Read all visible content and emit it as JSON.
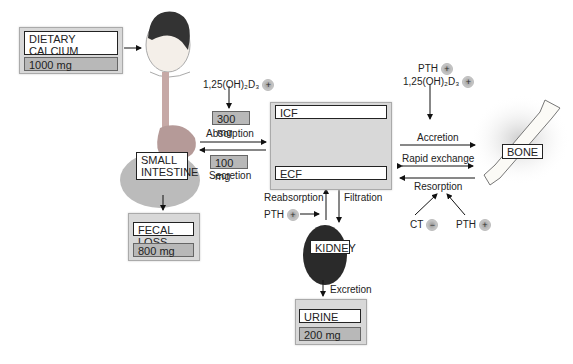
{
  "intake": {
    "title": "DIETARY CALCIUM INTAKE",
    "line1": "DIETARY CALCIUM",
    "line2": "INTAKE",
    "amount": "1000 mg"
  },
  "vitd_absorption": {
    "label": "1,25(OH)₂D₃",
    "sign": "+"
  },
  "absorption": {
    "amount": "300 mg",
    "label": "Absorption"
  },
  "secretion": {
    "amount": "100 mg",
    "label": "Secretion"
  },
  "small_intestine": {
    "line1": "SMALL",
    "line2": "INTESTINE"
  },
  "fecal": {
    "label": "FECAL LOSS",
    "amount": "800 mg"
  },
  "compartments": {
    "icf": "ICF",
    "ecf": "ECF"
  },
  "kidney": {
    "label": "KIDNEY",
    "reabsorption": "Reabsorption",
    "filtration": "Filtration",
    "pth": "PTH",
    "pth_sign": "+",
    "excretion": "Excretion"
  },
  "urine": {
    "label": "URINE",
    "amount": "200 mg"
  },
  "bone": {
    "label": "BONE",
    "accretion": "Accretion",
    "rapid_exchange": "Rapid exchange",
    "resorption": "Resorption",
    "pth_top": "PTH",
    "pth_top_sign": "+",
    "vitd_top": "1,25(OH)₂D₃",
    "vitd_top_sign": "+",
    "ct": "CT",
    "ct_sign": "−",
    "pth_bottom": "PTH",
    "pth_bottom_sign": "+"
  }
}
